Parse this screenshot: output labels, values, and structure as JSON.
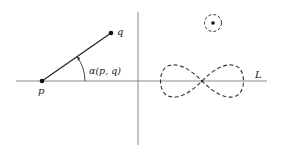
{
  "figure": {
    "labels": {
      "p": "p",
      "q": "q",
      "angle": "α(p, q)",
      "line": "L"
    },
    "colors": {
      "stroke": "#222222",
      "axis": "#888888"
    },
    "elements": {
      "horizontal_line": {
        "x1": 16,
        "y1": 81,
        "x2": 267,
        "y2": 81
      },
      "vertical_line": {
        "x1": 138,
        "y1": 12,
        "x2": 138,
        "y2": 145
      },
      "point_p": {
        "x": 42,
        "y": 81
      },
      "point_q": {
        "x": 111,
        "y": 33
      },
      "small_circle": {
        "cx": 213,
        "cy": 23,
        "r": 9
      },
      "lemniscate": {
        "cx": 202,
        "cy": 81,
        "half_width": 42
      }
    }
  }
}
